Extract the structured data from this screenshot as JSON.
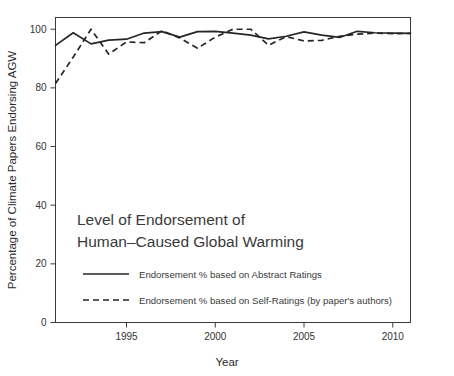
{
  "figure": {
    "background_color": "#ffffff",
    "line_color": "#262626",
    "axis_color": "#3b3b3b",
    "text_color": "#3a3a3a"
  },
  "chart_data": {
    "type": "line",
    "title_line1": "Level of Endorsement of",
    "title_line2": "Human–Caused Global Warming",
    "xlabel": "Year",
    "ylabel": "Percentage of Climate Papers Endorsing AGW",
    "xlim": [
      1991,
      2011
    ],
    "ylim": [
      0,
      104
    ],
    "xticks": [
      1995,
      2000,
      2005,
      2010
    ],
    "xtick_labels": [
      "1995",
      "2000",
      "2005",
      "2010"
    ],
    "yticks": [
      0,
      20,
      40,
      60,
      80,
      100
    ],
    "ytick_labels": [
      "0",
      "20",
      "40",
      "60",
      "80",
      "100"
    ],
    "grid": false,
    "legend_position": "inside-lower-left",
    "x": [
      1991,
      1992,
      1993,
      1994,
      1995,
      1996,
      1997,
      1998,
      1999,
      2000,
      2001,
      2002,
      2003,
      2004,
      2005,
      2006,
      2007,
      2008,
      2009,
      2010,
      2011
    ],
    "series": [
      {
        "name": "Endorsement % based on Abstract Ratings",
        "style": "solid",
        "values": [
          94.5,
          98.8,
          95.0,
          96.3,
          96.6,
          98.7,
          99.2,
          97.3,
          99.2,
          99.3,
          98.7,
          98.0,
          96.7,
          97.6,
          99.1,
          98.0,
          97.2,
          99.3,
          98.8,
          98.7,
          98.6
        ]
      },
      {
        "name": "Endorsement % based on Self-Ratings (by paper's authors)",
        "style": "dashed",
        "values": [
          81.5,
          90.5,
          100.0,
          91.5,
          95.7,
          95.4,
          99.5,
          97.0,
          93.5,
          97.3,
          100.0,
          100.0,
          94.5,
          97.5,
          96.0,
          96.2,
          97.6,
          98.3,
          98.7,
          98.5,
          98.6
        ]
      }
    ]
  },
  "legend": {
    "items": [
      {
        "style": "solid",
        "label": "Endorsement % based on Abstract Ratings"
      },
      {
        "style": "dashed",
        "label": "Endorsement % based on Self-Ratings (by paper's authors)"
      }
    ]
  }
}
